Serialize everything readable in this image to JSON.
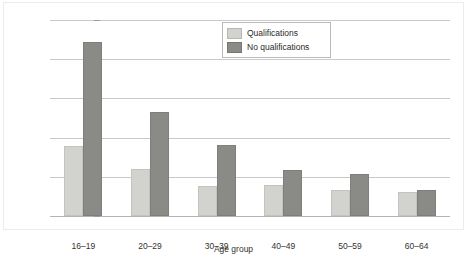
{
  "chart_data": {
    "type": "bar",
    "title": "",
    "xlabel": "Age group",
    "ylabel": "Percentage of men unemployed",
    "categories": [
      "16–19",
      "20–29",
      "30–39",
      "40–49",
      "50–59",
      "60–64"
    ],
    "series": [
      {
        "name": "Qualifications",
        "color": "#d2d2ce",
        "values": [
          17.8,
          12.1,
          7.7,
          7.9,
          6.6,
          6.1
        ]
      },
      {
        "name": "No qualifications",
        "color": "#8a8a87",
        "values": [
          44.3,
          26.5,
          18.2,
          11.7,
          10.7,
          6.7
        ]
      }
    ],
    "ylim": [
      0,
      50
    ],
    "yticks": [
      0,
      10,
      20,
      30,
      40,
      50
    ],
    "ytick_labels": [
      "0",
      "10",
      "20",
      "30",
      "40",
      "50"
    ],
    "grid": true,
    "legend_position": "top-center"
  },
  "legend": {
    "entries": [
      {
        "label": "Qualifications"
      },
      {
        "label": "No qualifications"
      }
    ]
  }
}
